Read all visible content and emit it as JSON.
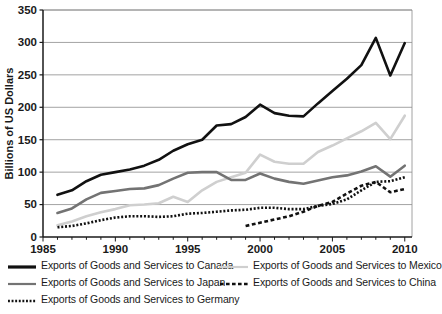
{
  "chart_data": {
    "type": "line",
    "title": "",
    "xlabel": "",
    "ylabel": "Billions of US Dollars",
    "xlim": [
      1985,
      2010.5
    ],
    "ylim": [
      0,
      350
    ],
    "yticks": [
      0,
      50,
      100,
      150,
      200,
      250,
      300,
      350
    ],
    "xticks": [
      1985,
      1990,
      1995,
      2000,
      2005,
      2010
    ],
    "xtick_interval_minor": 1,
    "grid": "horizontal",
    "legend_position": "below",
    "series": [
      {
        "name": "Exports of Goods and Services to Canada",
        "color": "#111111",
        "style": "solid",
        "width": 2.6,
        "x": [
          1986,
          1987,
          1988,
          1989,
          1990,
          1991,
          1992,
          1993,
          1994,
          1995,
          1996,
          1997,
          1998,
          1999,
          2000,
          2001,
          2002,
          2003,
          2004,
          2005,
          2006,
          2007,
          2008,
          2009,
          2010
        ],
        "values": [
          65,
          72,
          86,
          96,
          100,
          104,
          110,
          119,
          133,
          143,
          150,
          172,
          174,
          185,
          204,
          191,
          187,
          186,
          206,
          225,
          244,
          265,
          307,
          249,
          299
        ]
      },
      {
        "name": "Exports of Goods and Services to Mexico",
        "color": "#cfcfcf",
        "style": "solid",
        "width": 2.6,
        "x": [
          1986,
          1987,
          1988,
          1989,
          1990,
          1991,
          1992,
          1993,
          1994,
          1995,
          1996,
          1997,
          1998,
          1999,
          2000,
          2001,
          2002,
          2003,
          2004,
          2005,
          2006,
          2007,
          2008,
          2009,
          2010
        ],
        "values": [
          18,
          24,
          32,
          38,
          43,
          49,
          50,
          52,
          62,
          54,
          72,
          85,
          92,
          99,
          127,
          116,
          113,
          113,
          131,
          141,
          152,
          163,
          176,
          151,
          187
        ]
      },
      {
        "name": "Exports of Goods and Services to Japan",
        "color": "#737373",
        "style": "solid",
        "width": 2.6,
        "x": [
          1986,
          1987,
          1988,
          1989,
          1990,
          1991,
          1992,
          1993,
          1994,
          1995,
          1996,
          1997,
          1998,
          1999,
          2000,
          2001,
          2002,
          2003,
          2004,
          2005,
          2006,
          2007,
          2008,
          2009,
          2010
        ],
        "values": [
          37,
          44,
          58,
          68,
          71,
          74,
          75,
          80,
          90,
          99,
          100,
          100,
          88,
          88,
          98,
          90,
          85,
          82,
          87,
          92,
          95,
          101,
          109,
          93,
          110
        ]
      },
      {
        "name": "Exports of Goods and Services to China",
        "color": "#111111",
        "style": "dashed",
        "width": 2.6,
        "x": [
          1999,
          2000,
          2001,
          2002,
          2003,
          2004,
          2005,
          2006,
          2007,
          2008,
          2009,
          2010
        ],
        "values": [
          17,
          22,
          27,
          32,
          39,
          48,
          54,
          67,
          79,
          85,
          69,
          74
        ]
      },
      {
        "name": "Exports of Goods and Services to Germany",
        "color": "#111111",
        "style": "dotted",
        "width": 2.6,
        "x": [
          1986,
          1987,
          1988,
          1989,
          1990,
          1991,
          1992,
          1993,
          1994,
          1995,
          1996,
          1997,
          1998,
          1999,
          2000,
          2001,
          2002,
          2003,
          2004,
          2005,
          2006,
          2007,
          2008,
          2009,
          2010
        ],
        "values": [
          15,
          17,
          21,
          26,
          30,
          32,
          32,
          31,
          32,
          36,
          37,
          39,
          41,
          42,
          45,
          45,
          43,
          43,
          48,
          51,
          58,
          72,
          85,
          86,
          92
        ]
      }
    ]
  },
  "legend": {
    "entries": [
      {
        "label": "Exports of Goods and Services to Canada",
        "style": "solid",
        "color": "#111111",
        "width": 3.2
      },
      {
        "label": "Exports of Goods and Services to Mexico",
        "style": "solid",
        "color": "#cfcfcf",
        "width": 2.2
      },
      {
        "label": "Exports of Goods and Services to Japan",
        "style": "solid",
        "color": "#737373",
        "width": 2.2
      },
      {
        "label": "Exports of Goods and Services to China",
        "style": "dashed",
        "color": "#111111",
        "width": 2.6
      },
      {
        "label": "Exports of Goods and Services to Germany",
        "style": "dotted",
        "color": "#111111",
        "width": 2.6
      }
    ]
  }
}
